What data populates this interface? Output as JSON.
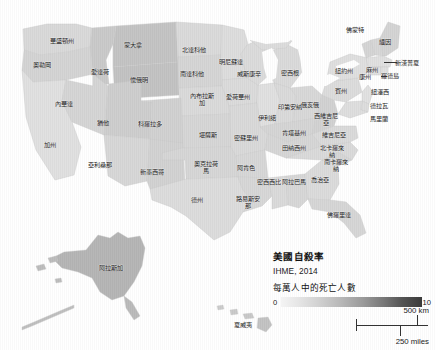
{
  "figure": {
    "name": "us-suicide-rate-choropleth",
    "domain": "map"
  },
  "legend": {
    "title": "美國自殺率",
    "source": "IHME, 2014",
    "unit_label": "每萬人中的死亡人數",
    "ramp_min": "0",
    "ramp_max": "10",
    "ramp_color_low": "#f4f4f4",
    "ramp_color_high": "#3a3a3a"
  },
  "scale_bar": {
    "km_label": "500 km",
    "miles_label": "250 miles"
  },
  "states": [
    {
      "label": "華盛頓州",
      "x": 62,
      "y": 41
    },
    {
      "label": "奧勒岡",
      "x": 42,
      "y": 65
    },
    {
      "label": "蒙大拿",
      "x": 133,
      "y": 45
    },
    {
      "label": "愛達荷",
      "x": 100,
      "y": 72
    },
    {
      "label": "懷俄明",
      "x": 139,
      "y": 80
    },
    {
      "label": "北達科他",
      "x": 194,
      "y": 50
    },
    {
      "label": "南達科他",
      "x": 192,
      "y": 74
    },
    {
      "label": "明尼蘇達",
      "x": 231,
      "y": 62
    },
    {
      "label": "威斯康辛",
      "x": 249,
      "y": 74
    },
    {
      "label": "內華達",
      "x": 64,
      "y": 104
    },
    {
      "label": "猶他",
      "x": 103,
      "y": 123
    },
    {
      "label": "科羅拉多",
      "x": 150,
      "y": 124
    },
    {
      "label": "加州",
      "x": 50,
      "y": 145
    },
    {
      "label": "亞利桑那",
      "x": 100,
      "y": 165
    },
    {
      "label": "新墨西哥",
      "x": 152,
      "y": 172
    },
    {
      "label": "內布拉斯加",
      "x": 202,
      "y": 100
    },
    {
      "label": "愛荷華州",
      "x": 238,
      "y": 97
    },
    {
      "label": "堪薩斯",
      "x": 208,
      "y": 135
    },
    {
      "label": "密蘇里州",
      "x": 246,
      "y": 138
    },
    {
      "label": "奧克拉荷馬",
      "x": 206,
      "y": 168
    },
    {
      "label": "阿肯色",
      "x": 246,
      "y": 168
    },
    {
      "label": "伊利諾",
      "x": 267,
      "y": 118
    },
    {
      "label": "印第安納",
      "x": 290,
      "y": 107
    },
    {
      "label": "俄亥俄",
      "x": 310,
      "y": 105
    },
    {
      "label": "密西根",
      "x": 290,
      "y": 73
    },
    {
      "label": "肯塔基州",
      "x": 294,
      "y": 133
    },
    {
      "label": "田納西州",
      "x": 294,
      "y": 148
    },
    {
      "label": "密西西比",
      "x": 269,
      "y": 182
    },
    {
      "label": "路易斯安那",
      "x": 248,
      "y": 203
    },
    {
      "label": "德州",
      "x": 197,
      "y": 200
    },
    {
      "label": "阿拉巴馬",
      "x": 294,
      "y": 182
    },
    {
      "label": "喬治亞",
      "x": 320,
      "y": 180
    },
    {
      "label": "佛羅里達",
      "x": 339,
      "y": 215
    },
    {
      "label": "西維吉尼亞",
      "x": 326,
      "y": 120
    },
    {
      "label": "維吉尼亞",
      "x": 334,
      "y": 135
    },
    {
      "label": "北卡羅來納",
      "x": 332,
      "y": 152
    },
    {
      "label": "南卡羅來納",
      "x": 336,
      "y": 166
    },
    {
      "label": "紐約州",
      "x": 344,
      "y": 71
    },
    {
      "label": "賓州",
      "x": 341,
      "y": 91
    },
    {
      "label": "麻州",
      "x": 372,
      "y": 70
    },
    {
      "label": "康州",
      "x": 365,
      "y": 77
    },
    {
      "label": "羅德島",
      "x": 390,
      "y": 76
    },
    {
      "label": "佛蒙特",
      "x": 355,
      "y": 30
    },
    {
      "label": "緬因",
      "x": 385,
      "y": 42
    },
    {
      "label": "新漢普夏",
      "x": 407,
      "y": 63
    },
    {
      "label": "紐澤西",
      "x": 380,
      "y": 92
    },
    {
      "label": "德拉瓦",
      "x": 379,
      "y": 106
    },
    {
      "label": "馬里蘭",
      "x": 379,
      "y": 119
    },
    {
      "label": "阿拉斯加",
      "x": 111,
      "y": 268
    },
    {
      "label": "夏威夷",
      "x": 243,
      "y": 325
    }
  ],
  "chart_data": {
    "type": "choropleth-map",
    "title": "美國自殺率",
    "subtitle": "IHME, 2014",
    "value_label": "每萬人中的死亡人數",
    "colorbar": {
      "min": 0,
      "max": 10,
      "low_color": "#f4f4f4",
      "high_color": "#3a3a3a"
    },
    "regions": [
      {
        "name": "華盛頓州",
        "value": 5.2
      },
      {
        "name": "奧勒岡",
        "value": 6.0
      },
      {
        "name": "蒙大拿",
        "value": 8.8
      },
      {
        "name": "愛達荷",
        "value": 7.9
      },
      {
        "name": "懷俄明",
        "value": 9.2
      },
      {
        "name": "北達科他",
        "value": 5.6
      },
      {
        "name": "南達科他",
        "value": 6.4
      },
      {
        "name": "明尼蘇達",
        "value": 4.4
      },
      {
        "name": "威斯康辛",
        "value": 4.6
      },
      {
        "name": "內華達",
        "value": 6.8
      },
      {
        "name": "猶他",
        "value": 7.4
      },
      {
        "name": "科羅拉多",
        "value": 6.6
      },
      {
        "name": "加州",
        "value": 3.6
      },
      {
        "name": "亞利桑那",
        "value": 6.2
      },
      {
        "name": "新墨西哥",
        "value": 7.6
      },
      {
        "name": "內布拉斯加",
        "value": 4.6
      },
      {
        "name": "愛荷華州",
        "value": 4.4
      },
      {
        "name": "堪薩斯",
        "value": 5.2
      },
      {
        "name": "密蘇里州",
        "value": 5.4
      },
      {
        "name": "奧克拉荷馬",
        "value": 6.2
      },
      {
        "name": "阿肯色",
        "value": 5.8
      },
      {
        "name": "伊利諾",
        "value": 3.6
      },
      {
        "name": "印第安納",
        "value": 4.8
      },
      {
        "name": "俄亥俄",
        "value": 4.6
      },
      {
        "name": "密西根",
        "value": 4.6
      },
      {
        "name": "肯塔基州",
        "value": 5.6
      },
      {
        "name": "田納西州",
        "value": 5.4
      },
      {
        "name": "密西西比",
        "value": 4.8
      },
      {
        "name": "路易斯安那",
        "value": 5.2
      },
      {
        "name": "德州",
        "value": 4.4
      },
      {
        "name": "阿拉巴馬",
        "value": 5.0
      },
      {
        "name": "喬治亞",
        "value": 4.4
      },
      {
        "name": "佛羅里達",
        "value": 5.2
      },
      {
        "name": "西維吉尼亞",
        "value": 6.0
      },
      {
        "name": "維吉尼亞",
        "value": 4.8
      },
      {
        "name": "北卡羅來納",
        "value": 4.8
      },
      {
        "name": "南卡羅來納",
        "value": 5.0
      },
      {
        "name": "紐約州",
        "value": 3.2
      },
      {
        "name": "賓州",
        "value": 4.4
      },
      {
        "name": "麻州",
        "value": 3.4
      },
      {
        "name": "康州",
        "value": 3.6
      },
      {
        "name": "羅德島",
        "value": 3.6
      },
      {
        "name": "佛蒙特",
        "value": 5.2
      },
      {
        "name": "緬因",
        "value": 5.4
      },
      {
        "name": "新漢普夏",
        "value": 5.0
      },
      {
        "name": "紐澤西",
        "value": 3.0
      },
      {
        "name": "德拉瓦",
        "value": 4.4
      },
      {
        "name": "馬里蘭",
        "value": 4.0
      },
      {
        "name": "阿拉斯加",
        "value": 9.6
      },
      {
        "name": "夏威夷",
        "value": 4.4
      }
    ]
  }
}
